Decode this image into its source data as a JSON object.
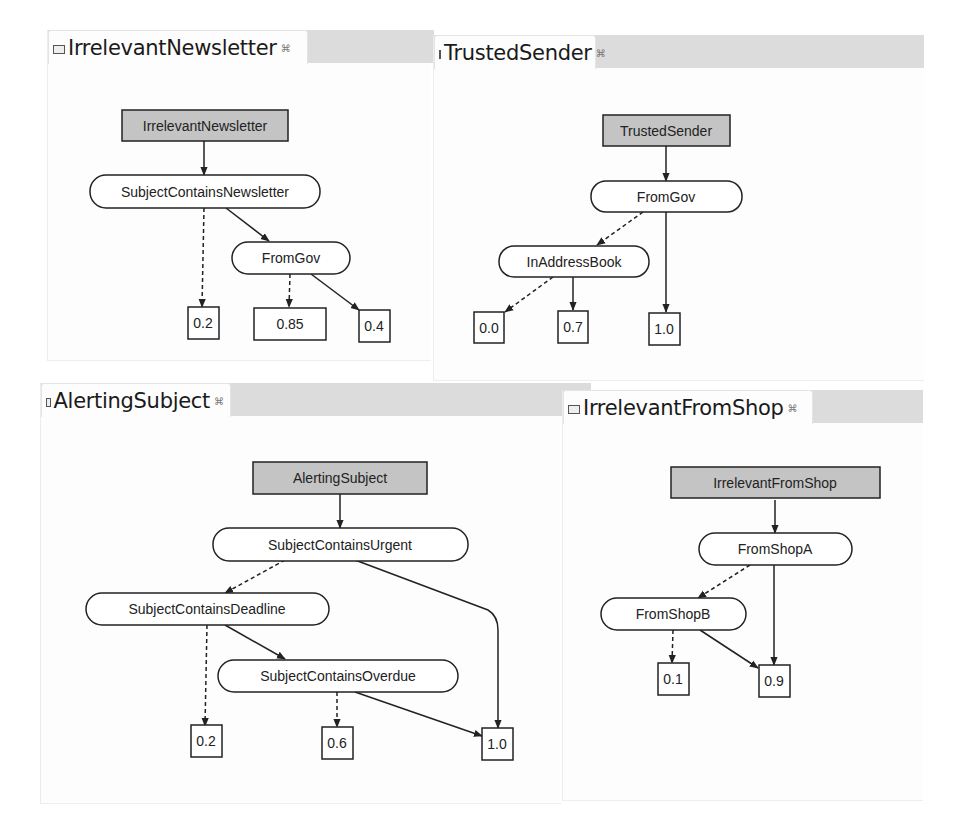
{
  "panels": [
    {
      "id": "IrrelevantNewsletter",
      "tab_title": "IrrelevantNewsletter",
      "close_icon": "close-x-icon",
      "nodes": {
        "root": "IrrelevantNewsletter",
        "n1": "SubjectContainsNewsletter",
        "n2": "FromGov",
        "l1": "0.2",
        "l2": "0.85",
        "l3": "0.4"
      }
    },
    {
      "id": "TrustedSender",
      "tab_title": "TrustedSender",
      "close_icon": "close-x-icon",
      "nodes": {
        "root": "TrustedSender",
        "n1": "FromGov",
        "n2": "InAddressBook",
        "l1": "0.0",
        "l2": "0.7",
        "l3": "1.0"
      }
    },
    {
      "id": "AlertingSubject",
      "tab_title": "AlertingSubject",
      "close_icon": "close-x-icon",
      "nodes": {
        "root": "AlertingSubject",
        "n1": "SubjectContainsUrgent",
        "n2": "SubjectContainsDeadline",
        "n3": "SubjectContainsOverdue",
        "l1": "0.2",
        "l2": "0.6",
        "l3": "1.0"
      }
    },
    {
      "id": "IrrelevantFromShop",
      "tab_title": "IrrelevantFromShop",
      "close_icon": "close-x-icon",
      "nodes": {
        "root": "IrrelevantFromShop",
        "n1": "FromShopA",
        "n2": "FromShopB",
        "l1": "0.1",
        "l2": "0.9"
      }
    }
  ],
  "legend": {
    "solid_edge": "true branch",
    "dashed_edge": "false branch"
  },
  "colors": {
    "root_fill": "#c4c4c4",
    "node_fill": "#ffffff",
    "stroke": "#222222",
    "tabbar": "#dcdcdc"
  }
}
